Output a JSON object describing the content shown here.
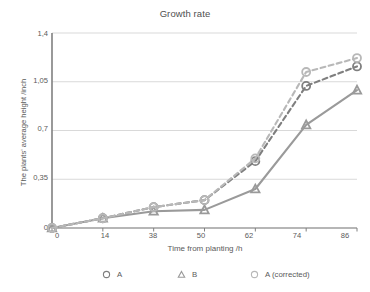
{
  "chart_data": {
    "type": "line",
    "title": "Growth rate",
    "xlabel": "Time from planting /h",
    "ylabel": "The plants' average height /inch",
    "categories": [
      "0",
      "14",
      "38",
      "50",
      "62",
      "74",
      "86"
    ],
    "x_tick_labels": [
      "0",
      "14",
      "38",
      "50",
      "62",
      "74",
      "86"
    ],
    "y_tick_labels": [
      "0",
      "0,35",
      "0,7",
      "1,05",
      "1,4"
    ],
    "y_tick_values": [
      0,
      0.35,
      0.7,
      1.05,
      1.4
    ],
    "ylim": [
      0,
      1.4
    ],
    "grid": true,
    "grid_axis": "y",
    "legend_position": "bottom",
    "decimal_separator": ",",
    "series": [
      {
        "name": "A",
        "values": [
          0,
          0.07,
          0.15,
          0.2,
          0.48,
          1.02,
          1.16
        ],
        "color": "#7f7f7f",
        "line_style": "dashed",
        "marker": "circle"
      },
      {
        "name": "B",
        "values": [
          0,
          0.07,
          0.12,
          0.13,
          0.28,
          0.74,
          0.99
        ],
        "color": "#9a9a9a",
        "line_style": "solid",
        "marker": "triangle"
      },
      {
        "name": "A (corrected)",
        "values": [
          0,
          0.07,
          0.15,
          0.2,
          0.5,
          1.12,
          1.22
        ],
        "color": "#b8b8b8",
        "line_style": "dashed",
        "marker": "circle"
      }
    ]
  },
  "axis": {
    "y_labels": [
      "1,4",
      "1,05",
      "0,7",
      "0,35",
      "0"
    ],
    "x_labels": [
      "0",
      "14",
      "38",
      "50",
      "62",
      "74",
      "86"
    ]
  },
  "legend": {
    "items": [
      {
        "label": "A",
        "marker": "circle-marker-icon"
      },
      {
        "label": "B",
        "marker": "triangle-marker-icon"
      },
      {
        "label": "A (corrected)",
        "marker": "circle-marker-icon"
      }
    ]
  },
  "colors": {
    "series_a": "#7f7f7f",
    "series_b": "#9a9a9a",
    "series_a_corrected": "#b8b8b8",
    "axis": "#808080",
    "grid": "#d9d9d9",
    "text": "#5a5a5a"
  }
}
